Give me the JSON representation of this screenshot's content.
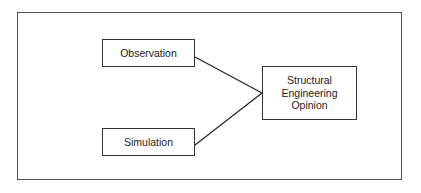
{
  "diagram": {
    "nodes": [
      {
        "id": "observation",
        "label": "Observation"
      },
      {
        "id": "simulation",
        "label": "Simulation"
      },
      {
        "id": "structural_engineering_opinion",
        "label_lines": [
          "Structural",
          "Engineering",
          "Opinion"
        ]
      }
    ],
    "edges": [
      {
        "from": "observation",
        "to": "structural_engineering_opinion"
      },
      {
        "from": "simulation",
        "to": "structural_engineering_opinion"
      }
    ]
  }
}
